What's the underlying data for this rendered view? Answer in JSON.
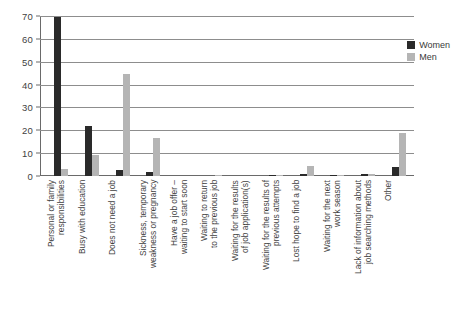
{
  "chart_data": {
    "type": "bar",
    "title": "",
    "xlabel": "",
    "ylabel": "",
    "ylim": [
      0,
      70
    ],
    "ytick_values": [
      70,
      60,
      50,
      40,
      30,
      20,
      10,
      0
    ],
    "grid": true,
    "legend_position": "top-right",
    "categories": [
      "Personal or family\nresponsibilities",
      "Busy with education",
      "Does not need a job",
      "Sickness, temporary\nweakness or pregnancy",
      "Have a job offer –\nwaiting to start soon",
      "Waiting to return\nto the previous job",
      "Waiting for the results\nof job application(s)",
      "Waiting for the results of\nprevious attempts",
      "Lost hope to find a job",
      "Waiting for the next\nwork season",
      "Lack of information about\njob searching methods",
      "Other"
    ],
    "series": [
      {
        "name": "Women",
        "color": "#2a2a2a",
        "values": [
          69.5,
          22.0,
          2.6,
          1.7,
          0.0,
          0.0,
          0.0,
          0.6,
          0.8,
          0.3,
          0.9,
          3.8
        ]
      },
      {
        "name": "Men",
        "color": "#b5b5b5",
        "values": [
          3.0,
          9.2,
          44.5,
          16.8,
          0.0,
          0.6,
          0.0,
          0.5,
          4.5,
          0.5,
          0.8,
          19.0
        ]
      }
    ]
  },
  "legend": {
    "items": [
      {
        "label": "Women",
        "color": "#2a2a2a"
      },
      {
        "label": "Men",
        "color": "#b5b5b5"
      }
    ]
  }
}
